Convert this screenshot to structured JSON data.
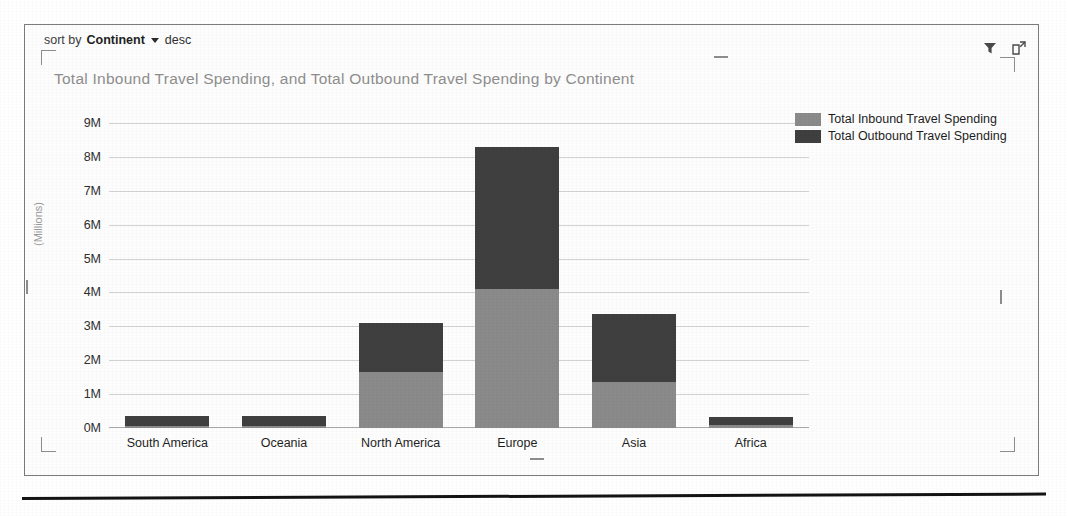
{
  "frame": {
    "sort_control": {
      "prefix": "sort by",
      "field": "Continent",
      "caret": "chevron-down-icon",
      "direction": "desc"
    },
    "actions": [
      {
        "name": "filter-icon",
        "tooltip": "Filter"
      },
      {
        "name": "focus-mode-icon",
        "tooltip": "Focus mode"
      }
    ]
  },
  "chart_data": {
    "type": "bar",
    "stacked": true,
    "title": "Total Inbound Travel Spending, and Total Outbound Travel Spending by Continent",
    "xlabel": "",
    "ylabel": "(Millions)",
    "ylim": [
      0,
      9000000
    ],
    "ytick_labels": [
      "0M",
      "1M",
      "2M",
      "3M",
      "4M",
      "5M",
      "6M",
      "7M",
      "8M",
      "9M"
    ],
    "ytick_values": [
      0,
      1000000,
      2000000,
      3000000,
      4000000,
      5000000,
      6000000,
      7000000,
      8000000,
      9000000
    ],
    "grid": true,
    "legend_position": "top-right",
    "categories": [
      "South America",
      "Oceania",
      "North America",
      "Europe",
      "Asia",
      "Africa"
    ],
    "series": [
      {
        "name": "Total Inbound Travel Spending",
        "color": "#8a8a8a",
        "values": [
          60000,
          70000,
          1650000,
          4100000,
          1350000,
          80000
        ]
      },
      {
        "name": "Total Outbound Travel Spending",
        "color": "#3f3f3f",
        "values": [
          290000,
          290000,
          1450000,
          4200000,
          2000000,
          240000
        ]
      }
    ],
    "totals": [
      350000,
      360000,
      3100000,
      8300000,
      3350000,
      320000
    ]
  }
}
